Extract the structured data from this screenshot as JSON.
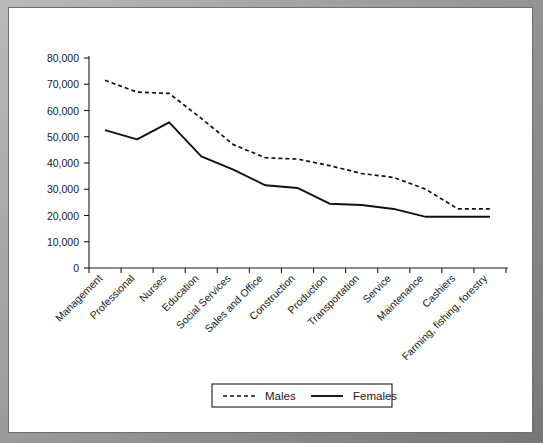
{
  "chart_data": {
    "type": "line",
    "title": "",
    "xlabel": "",
    "ylabel": "",
    "ylim": [
      0,
      80000
    ],
    "yticks": [
      0,
      10000,
      20000,
      30000,
      40000,
      50000,
      60000,
      70000,
      80000
    ],
    "ytick_labels": [
      "0",
      "10,000",
      "20,000",
      "30,000",
      "40,000",
      "50,000",
      "60,000",
      "70,000",
      "80,000"
    ],
    "grid": false,
    "legend_position": "bottom",
    "categories": [
      "Management",
      "Professional",
      "Nurses",
      "Education",
      "Social Services",
      "Sales and Office",
      "Construction",
      "Production",
      "Transportation",
      "Service",
      "Maintenance",
      "Cashiers",
      "Farming, fishing, forestry"
    ],
    "series": [
      {
        "name": "Males",
        "style": "dashed",
        "color": "#101010",
        "values": [
          71500,
          67000,
          66500,
          57000,
          47000,
          42000,
          41500,
          39000,
          36000,
          34500,
          30000,
          22500,
          22500
        ]
      },
      {
        "name": "Females",
        "style": "solid",
        "color": "#101010",
        "values": [
          52500,
          49000,
          55500,
          42500,
          37500,
          31500,
          30500,
          24500,
          24000,
          22500,
          19500,
          19500,
          19500
        ]
      }
    ]
  },
  "legend": {
    "entries": [
      {
        "label": "Males",
        "style": "dashed"
      },
      {
        "label": "Females",
        "style": "solid"
      }
    ]
  },
  "axis": {
    "y_axis_name": "y-axis",
    "x_axis_name": "x-axis"
  }
}
